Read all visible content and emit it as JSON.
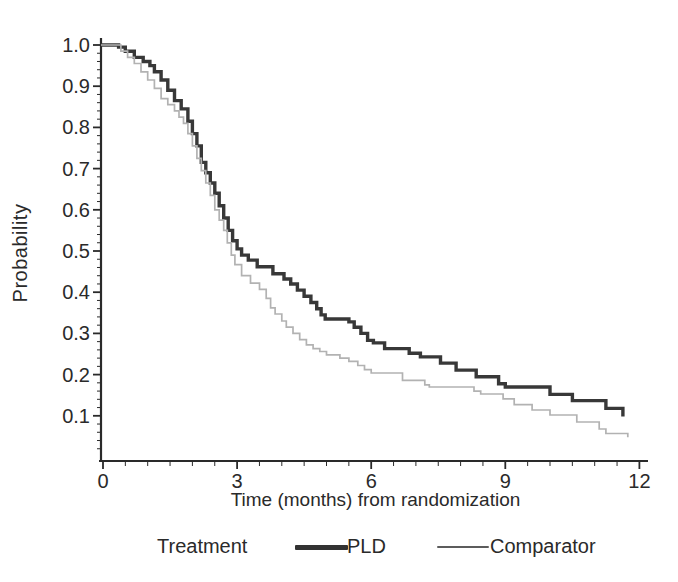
{
  "figure": {
    "y_axis": {
      "label": "Probability"
    },
    "x_axis": {
      "label": "Time (months) from randomization"
    },
    "legend": {
      "title": "Treatment",
      "items": [
        {
          "label": "PLD",
          "swatch": "thick-dark-line"
        },
        {
          "label": "Comparator",
          "swatch": "thin-gray-line"
        }
      ]
    }
  },
  "chart_data": {
    "type": "line",
    "subtype": "kaplan-meier-step",
    "title": "",
    "xlabel": "Time (months) from randomization",
    "ylabel": "Probability",
    "xlim": [
      0,
      12
    ],
    "ylim": [
      0,
      1.0
    ],
    "x_ticks": [
      0,
      3,
      6,
      9,
      12
    ],
    "x_minor_tick_step": 0.5,
    "y_ticks": [
      0.1,
      0.2,
      0.3,
      0.4,
      0.5,
      0.6,
      0.7,
      0.8,
      0.9,
      1.0
    ],
    "y_minor_tick_step": 0.02,
    "grid": false,
    "legend_position": "bottom",
    "colors": {
      "pld": "#383838",
      "comparator": "#b2b2b2",
      "axis": "#2a2a2a"
    },
    "series": [
      {
        "name": "PLD",
        "color": "#383838",
        "line_width": 3.4,
        "points": [
          [
            0,
            1.0
          ],
          [
            0.35,
            0.995
          ],
          [
            0.5,
            0.985
          ],
          [
            0.7,
            0.97
          ],
          [
            0.9,
            0.96
          ],
          [
            1.05,
            0.95
          ],
          [
            1.15,
            0.935
          ],
          [
            1.3,
            0.915
          ],
          [
            1.45,
            0.89
          ],
          [
            1.6,
            0.865
          ],
          [
            1.75,
            0.845
          ],
          [
            1.9,
            0.815
          ],
          [
            2.0,
            0.785
          ],
          [
            2.1,
            0.755
          ],
          [
            2.2,
            0.715
          ],
          [
            2.3,
            0.69
          ],
          [
            2.4,
            0.665
          ],
          [
            2.5,
            0.64
          ],
          [
            2.6,
            0.61
          ],
          [
            2.7,
            0.58
          ],
          [
            2.8,
            0.55
          ],
          [
            2.9,
            0.525
          ],
          [
            3.0,
            0.505
          ],
          [
            3.1,
            0.49
          ],
          [
            3.25,
            0.478
          ],
          [
            3.45,
            0.462
          ],
          [
            3.8,
            0.445
          ],
          [
            4.05,
            0.432
          ],
          [
            4.2,
            0.42
          ],
          [
            4.35,
            0.405
          ],
          [
            4.5,
            0.39
          ],
          [
            4.65,
            0.375
          ],
          [
            4.78,
            0.36
          ],
          [
            4.88,
            0.345
          ],
          [
            4.97,
            0.335
          ],
          [
            5.5,
            0.328
          ],
          [
            5.62,
            0.315
          ],
          [
            5.77,
            0.3
          ],
          [
            5.92,
            0.283
          ],
          [
            6.05,
            0.277
          ],
          [
            6.3,
            0.263
          ],
          [
            6.85,
            0.252
          ],
          [
            7.1,
            0.243
          ],
          [
            7.55,
            0.228
          ],
          [
            7.9,
            0.211
          ],
          [
            8.35,
            0.195
          ],
          [
            8.85,
            0.178
          ],
          [
            9.0,
            0.17
          ],
          [
            10.0,
            0.152
          ],
          [
            10.5,
            0.137
          ],
          [
            11.25,
            0.118
          ],
          [
            11.63,
            0.098
          ]
        ]
      },
      {
        "name": "Comparator",
        "color": "#b2b2b2",
        "line_width": 1.7,
        "points": [
          [
            0,
            1.0
          ],
          [
            0.4,
            0.985
          ],
          [
            0.55,
            0.97
          ],
          [
            0.7,
            0.955
          ],
          [
            0.85,
            0.935
          ],
          [
            1.0,
            0.915
          ],
          [
            1.15,
            0.895
          ],
          [
            1.3,
            0.87
          ],
          [
            1.45,
            0.855
          ],
          [
            1.6,
            0.84
          ],
          [
            1.7,
            0.825
          ],
          [
            1.8,
            0.81
          ],
          [
            1.9,
            0.785
          ],
          [
            2.0,
            0.755
          ],
          [
            2.1,
            0.725
          ],
          [
            2.2,
            0.695
          ],
          [
            2.3,
            0.665
          ],
          [
            2.4,
            0.635
          ],
          [
            2.5,
            0.6
          ],
          [
            2.6,
            0.575
          ],
          [
            2.7,
            0.55
          ],
          [
            2.78,
            0.52
          ],
          [
            2.87,
            0.49
          ],
          [
            2.95,
            0.467
          ],
          [
            3.1,
            0.44
          ],
          [
            3.3,
            0.422
          ],
          [
            3.5,
            0.407
          ],
          [
            3.65,
            0.385
          ],
          [
            3.75,
            0.362
          ],
          [
            3.85,
            0.347
          ],
          [
            4.0,
            0.33
          ],
          [
            4.1,
            0.315
          ],
          [
            4.25,
            0.3
          ],
          [
            4.4,
            0.285
          ],
          [
            4.55,
            0.272
          ],
          [
            4.7,
            0.263
          ],
          [
            4.85,
            0.256
          ],
          [
            5.0,
            0.248
          ],
          [
            5.3,
            0.24
          ],
          [
            5.5,
            0.232
          ],
          [
            5.7,
            0.222
          ],
          [
            5.85,
            0.212
          ],
          [
            6.0,
            0.204
          ],
          [
            6.7,
            0.186
          ],
          [
            7.2,
            0.175
          ],
          [
            7.3,
            0.17
          ],
          [
            8.3,
            0.16
          ],
          [
            8.45,
            0.153
          ],
          [
            8.95,
            0.141
          ],
          [
            9.2,
            0.127
          ],
          [
            9.6,
            0.114
          ],
          [
            10.0,
            0.102
          ],
          [
            10.6,
            0.085
          ],
          [
            11.1,
            0.068
          ],
          [
            11.25,
            0.057
          ],
          [
            11.74,
            0.048
          ]
        ]
      }
    ]
  }
}
